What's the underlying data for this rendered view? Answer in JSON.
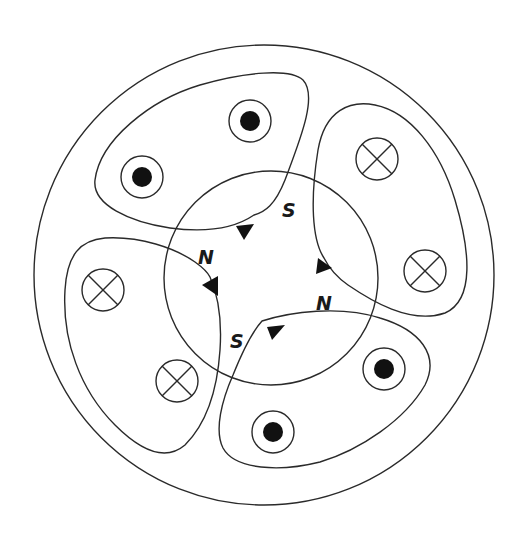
{
  "diagram": {
    "type": "two-pole machine cross-section with rotor and stator windings",
    "stator_outer_circle": {
      "cx": 264,
      "cy": 275,
      "r": 230
    },
    "rotor_circle": {
      "cx": 271,
      "cy": 278,
      "r": 107
    },
    "pole_labels": [
      {
        "id": "pole-n-upper-left",
        "text": "N",
        "x": 200,
        "y": 262,
        "rotate": 0
      },
      {
        "id": "pole-s-upper-right",
        "text": "S",
        "x": 285,
        "y": 214,
        "rotate": 0
      },
      {
        "id": "pole-n-lower-right",
        "text": "N",
        "x": 317,
        "y": 306,
        "rotate": 0
      },
      {
        "id": "pole-s-lower-left",
        "text": "S",
        "x": 232,
        "y": 345,
        "rotate": 0
      }
    ],
    "conductors": [
      {
        "id": "conductor-out-1",
        "kind": "dot",
        "label": "current out of page",
        "cx": 142,
        "cy": 177
      },
      {
        "id": "conductor-out-2",
        "kind": "dot",
        "label": "current out of page",
        "cx": 250,
        "cy": 121
      },
      {
        "id": "conductor-in-1",
        "kind": "cross",
        "label": "current into page",
        "cx": 377,
        "cy": 159
      },
      {
        "id": "conductor-in-2",
        "kind": "cross",
        "label": "current into page",
        "cx": 425,
        "cy": 271
      },
      {
        "id": "conductor-out-3",
        "kind": "dot",
        "label": "current out of page",
        "cx": 384,
        "cy": 369
      },
      {
        "id": "conductor-out-4",
        "kind": "dot",
        "label": "current out of page",
        "cx": 273,
        "cy": 432
      },
      {
        "id": "conductor-in-3",
        "kind": "cross",
        "label": "current into page",
        "cx": 177,
        "cy": 381
      },
      {
        "id": "conductor-in-4",
        "kind": "cross",
        "label": "current into page",
        "cx": 103,
        "cy": 290
      }
    ],
    "conductor_ring_radius": 21,
    "conductor_dot_radius": 10,
    "colors": {
      "line": "#2a2a2a",
      "fill": "#111111",
      "background": "#ffffff"
    }
  }
}
